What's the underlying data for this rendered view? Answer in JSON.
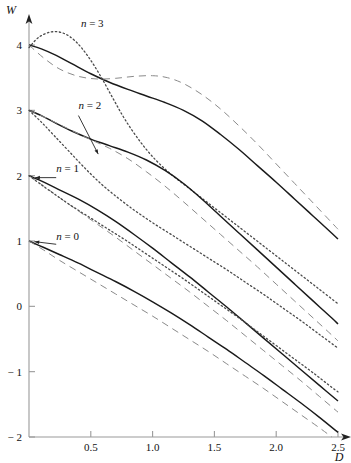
{
  "chart_data": {
    "type": "line",
    "title": "",
    "xlabel": "D",
    "ylabel": "W",
    "xlim": [
      0,
      2.5
    ],
    "ylim": [
      -2,
      4
    ],
    "grid": false,
    "legend_position": "inline-annotations",
    "xticks": [
      0.5,
      1.0,
      1.5,
      2.0,
      2.5
    ],
    "xtick_labels": [
      "0.5",
      "1.0",
      "1.5",
      "2.0",
      "2.5"
    ],
    "yticks": [
      -2,
      -1,
      0,
      1,
      2,
      3,
      4
    ],
    "ytick_labels": [
      "− 2",
      "− 1",
      "0",
      "1",
      "2",
      "3",
      "4"
    ],
    "annotations": [
      {
        "text_italic": "n",
        "text_rest": " = 3",
        "x": 0.42,
        "y": 4.28
      },
      {
        "text_italic": "n",
        "text_rest": " = 2",
        "x": 0.4,
        "y": 3.02
      },
      {
        "text_italic": "n",
        "text_rest": " = 1",
        "x": 0.22,
        "y": 2.05
      },
      {
        "text_italic": "n",
        "text_rest": " = 0",
        "x": 0.22,
        "y": 1.02
      }
    ],
    "series": [
      {
        "name": "n = 3 solid",
        "style": "solid",
        "color": "#1a1a1a",
        "points": [
          [
            0.0,
            4.0
          ],
          [
            0.1,
            3.94
          ],
          [
            0.22,
            3.84
          ],
          [
            0.35,
            3.71
          ],
          [
            0.5,
            3.56
          ],
          [
            0.65,
            3.43
          ],
          [
            0.8,
            3.32
          ],
          [
            0.95,
            3.22
          ],
          [
            1.1,
            3.12
          ],
          [
            1.25,
            3.0
          ],
          [
            1.4,
            2.84
          ],
          [
            1.55,
            2.63
          ],
          [
            1.7,
            2.4
          ],
          [
            1.85,
            2.15
          ],
          [
            2.0,
            1.9
          ],
          [
            2.15,
            1.64
          ],
          [
            2.3,
            1.38
          ],
          [
            2.45,
            1.12
          ],
          [
            2.5,
            1.03
          ]
        ]
      },
      {
        "name": "n = 3 dashed",
        "style": "dashed",
        "color": "#8a8a8a",
        "points": [
          [
            0.0,
            4.0
          ],
          [
            0.12,
            3.8
          ],
          [
            0.25,
            3.63
          ],
          [
            0.4,
            3.52
          ],
          [
            0.55,
            3.48
          ],
          [
            0.7,
            3.49
          ],
          [
            0.85,
            3.52
          ],
          [
            1.0,
            3.53
          ],
          [
            1.12,
            3.5
          ],
          [
            1.25,
            3.41
          ],
          [
            1.4,
            3.24
          ],
          [
            1.55,
            3.02
          ],
          [
            1.7,
            2.76
          ],
          [
            1.85,
            2.48
          ],
          [
            2.0,
            2.18
          ],
          [
            2.15,
            1.88
          ],
          [
            2.3,
            1.58
          ],
          [
            2.45,
            1.28
          ],
          [
            2.5,
            1.18
          ]
        ]
      },
      {
        "name": "n = 3 dotted",
        "style": "dotted",
        "color": "#4a4a4a",
        "points": [
          [
            0.0,
            3.96
          ],
          [
            0.08,
            4.12
          ],
          [
            0.18,
            4.2
          ],
          [
            0.28,
            4.18
          ],
          [
            0.38,
            4.05
          ],
          [
            0.48,
            3.82
          ],
          [
            0.58,
            3.52
          ],
          [
            0.68,
            3.18
          ],
          [
            0.78,
            2.85
          ],
          [
            0.9,
            2.52
          ],
          [
            1.02,
            2.25
          ],
          [
            1.15,
            2.02
          ],
          [
            1.3,
            1.8
          ],
          [
            1.45,
            1.58
          ],
          [
            1.6,
            1.36
          ],
          [
            1.75,
            1.14
          ],
          [
            1.9,
            0.92
          ],
          [
            2.05,
            0.7
          ],
          [
            2.2,
            0.48
          ],
          [
            2.35,
            0.26
          ],
          [
            2.5,
            0.04
          ]
        ]
      },
      {
        "name": "n = 2 solid",
        "style": "solid",
        "color": "#1a1a1a",
        "points": [
          [
            0.0,
            3.0
          ],
          [
            0.1,
            2.92
          ],
          [
            0.22,
            2.8
          ],
          [
            0.35,
            2.68
          ],
          [
            0.5,
            2.56
          ],
          [
            0.65,
            2.46
          ],
          [
            0.8,
            2.36
          ],
          [
            0.95,
            2.24
          ],
          [
            1.1,
            2.08
          ],
          [
            1.25,
            1.88
          ],
          [
            1.4,
            1.64
          ],
          [
            1.55,
            1.38
          ],
          [
            1.7,
            1.12
          ],
          [
            1.85,
            0.86
          ],
          [
            2.0,
            0.6
          ],
          [
            2.15,
            0.34
          ],
          [
            2.3,
            0.08
          ],
          [
            2.45,
            -0.18
          ],
          [
            2.5,
            -0.27
          ]
        ]
      },
      {
        "name": "n = 2 dashed",
        "style": "dashed",
        "color": "#8a8a8a",
        "points": [
          [
            0.0,
            3.0
          ],
          [
            0.12,
            2.9
          ],
          [
            0.25,
            2.78
          ],
          [
            0.38,
            2.66
          ],
          [
            0.5,
            2.55
          ],
          [
            0.65,
            2.42
          ],
          [
            0.8,
            2.26
          ],
          [
            0.95,
            2.06
          ],
          [
            1.1,
            1.84
          ],
          [
            1.25,
            1.6
          ],
          [
            1.4,
            1.35
          ],
          [
            1.55,
            1.1
          ],
          [
            1.7,
            0.85
          ],
          [
            1.85,
            0.6
          ],
          [
            2.0,
            0.34
          ],
          [
            2.15,
            0.08
          ],
          [
            2.3,
            -0.18
          ],
          [
            2.45,
            -0.44
          ],
          [
            2.5,
            -0.53
          ]
        ]
      },
      {
        "name": "n = 2 dotted",
        "style": "dotted",
        "color": "#4a4a4a",
        "points": [
          [
            0.0,
            3.0
          ],
          [
            0.1,
            2.82
          ],
          [
            0.2,
            2.62
          ],
          [
            0.32,
            2.38
          ],
          [
            0.45,
            2.12
          ],
          [
            0.58,
            1.88
          ],
          [
            0.72,
            1.66
          ],
          [
            0.86,
            1.46
          ],
          [
            1.0,
            1.28
          ],
          [
            1.15,
            1.1
          ],
          [
            1.3,
            0.92
          ],
          [
            1.45,
            0.74
          ],
          [
            1.6,
            0.56
          ],
          [
            1.75,
            0.37
          ],
          [
            1.9,
            0.18
          ],
          [
            2.05,
            -0.02
          ],
          [
            2.2,
            -0.22
          ],
          [
            2.35,
            -0.43
          ],
          [
            2.5,
            -0.64
          ]
        ]
      },
      {
        "name": "n = 1 solid",
        "style": "solid",
        "color": "#1a1a1a",
        "points": [
          [
            0.0,
            2.0
          ],
          [
            0.12,
            1.9
          ],
          [
            0.25,
            1.78
          ],
          [
            0.4,
            1.64
          ],
          [
            0.55,
            1.48
          ],
          [
            0.7,
            1.3
          ],
          [
            0.85,
            1.1
          ],
          [
            1.0,
            0.89
          ],
          [
            1.15,
            0.67
          ],
          [
            1.3,
            0.45
          ],
          [
            1.45,
            0.22
          ],
          [
            1.6,
            -0.01
          ],
          [
            1.75,
            -0.25
          ],
          [
            1.9,
            -0.49
          ],
          [
            2.05,
            -0.73
          ],
          [
            2.2,
            -0.97
          ],
          [
            2.35,
            -1.21
          ],
          [
            2.5,
            -1.45
          ]
        ]
      },
      {
        "name": "n = 1 dashed",
        "style": "dashed",
        "color": "#8a8a8a",
        "points": [
          [
            0.0,
            2.0
          ],
          [
            0.12,
            1.84
          ],
          [
            0.25,
            1.66
          ],
          [
            0.4,
            1.46
          ],
          [
            0.55,
            1.26
          ],
          [
            0.7,
            1.06
          ],
          [
            0.85,
            0.85
          ],
          [
            1.0,
            0.64
          ],
          [
            1.15,
            0.43
          ],
          [
            1.3,
            0.22
          ],
          [
            1.45,
            0.0
          ],
          [
            1.6,
            -0.22
          ],
          [
            1.75,
            -0.45
          ],
          [
            1.9,
            -0.68
          ],
          [
            2.05,
            -0.91
          ],
          [
            2.2,
            -1.14
          ],
          [
            2.35,
            -1.38
          ],
          [
            2.5,
            -1.62
          ]
        ]
      },
      {
        "name": "n = 1 dotted",
        "style": "dotted",
        "color": "#4a4a4a",
        "points": [
          [
            0.0,
            2.0
          ],
          [
            0.1,
            1.86
          ],
          [
            0.22,
            1.7
          ],
          [
            0.35,
            1.53
          ],
          [
            0.5,
            1.35
          ],
          [
            0.65,
            1.17
          ],
          [
            0.8,
            0.99
          ],
          [
            0.95,
            0.8
          ],
          [
            1.1,
            0.61
          ],
          [
            1.25,
            0.42
          ],
          [
            1.4,
            0.22
          ],
          [
            1.55,
            0.02
          ],
          [
            1.7,
            -0.18
          ],
          [
            1.85,
            -0.39
          ],
          [
            2.0,
            -0.6
          ],
          [
            2.15,
            -0.81
          ],
          [
            2.3,
            -1.02
          ],
          [
            2.45,
            -1.24
          ],
          [
            2.5,
            -1.31
          ]
        ]
      },
      {
        "name": "n = 0 solid",
        "style": "solid",
        "color": "#1a1a1a",
        "points": [
          [
            0.0,
            1.0
          ],
          [
            0.12,
            0.9
          ],
          [
            0.25,
            0.79
          ],
          [
            0.4,
            0.66
          ],
          [
            0.55,
            0.52
          ],
          [
            0.7,
            0.38
          ],
          [
            0.85,
            0.23
          ],
          [
            1.0,
            0.07
          ],
          [
            1.15,
            -0.1
          ],
          [
            1.3,
            -0.28
          ],
          [
            1.45,
            -0.47
          ],
          [
            1.6,
            -0.66
          ],
          [
            1.75,
            -0.86
          ],
          [
            1.9,
            -1.06
          ],
          [
            2.05,
            -1.27
          ],
          [
            2.2,
            -1.48
          ],
          [
            2.35,
            -1.7
          ],
          [
            2.5,
            -1.93
          ]
        ]
      },
      {
        "name": "n = 0 dashed",
        "style": "dashed",
        "color": "#8a8a8a",
        "points": [
          [
            0.0,
            1.0
          ],
          [
            0.12,
            0.86
          ],
          [
            0.25,
            0.7
          ],
          [
            0.4,
            0.53
          ],
          [
            0.55,
            0.36
          ],
          [
            0.7,
            0.19
          ],
          [
            0.85,
            0.02
          ],
          [
            1.0,
            -0.15
          ],
          [
            1.15,
            -0.33
          ],
          [
            1.3,
            -0.51
          ],
          [
            1.45,
            -0.69
          ],
          [
            1.6,
            -0.88
          ],
          [
            1.75,
            -1.07
          ],
          [
            1.9,
            -1.26
          ],
          [
            2.05,
            -1.46
          ],
          [
            2.2,
            -1.66
          ],
          [
            2.35,
            -1.86
          ],
          [
            2.45,
            -2.0
          ]
        ]
      }
    ]
  },
  "axes": {
    "y_axis_name": "W",
    "x_axis_name": "D"
  }
}
